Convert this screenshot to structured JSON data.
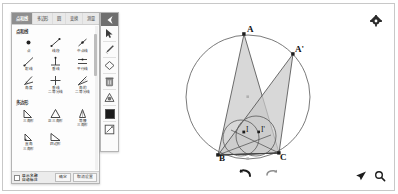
{
  "app": {
    "title": "几何画板",
    "accent": "#8f8f8f",
    "canvas_bg": "#ffffff",
    "shape_fill": "#c9c9c9",
    "stroke": "#4a4a4a"
  },
  "panel": {
    "tabs": [
      {
        "label": "点和线",
        "active": true
      },
      {
        "label": "多边形",
        "active": false
      },
      {
        "label": "圆",
        "active": false
      },
      {
        "label": "变换",
        "active": false
      },
      {
        "label": "测量",
        "active": false
      }
    ],
    "sections": [
      {
        "title": "点和线",
        "tools": [
          {
            "icon": "point-icon",
            "label": "点"
          },
          {
            "icon": "segment-icon",
            "label": "线段"
          },
          {
            "icon": "midpoint-icon",
            "label": "中点线"
          },
          {
            "icon": "ray-icon",
            "label": "射线"
          },
          {
            "icon": "perpendicular-icon",
            "label": "垂线"
          },
          {
            "icon": "parallel-icon",
            "label": "平行线"
          },
          {
            "icon": "angle-icon",
            "label": "角度"
          },
          {
            "icon": "perp-bisector-icon",
            "label": "垂线\n二等分线"
          },
          {
            "icon": "angle-bisector-icon",
            "label": "角的\n二等分线"
          }
        ]
      },
      {
        "title": "多边形",
        "tools": [
          {
            "icon": "triangle-right-icon",
            "label": "三角形"
          },
          {
            "icon": "triangle-equi-icon",
            "label": "正三角形"
          },
          {
            "icon": "triangle-iso-icon",
            "label": "等腰\n三角形"
          },
          {
            "icon": "triangle-rt-icon",
            "label": "直角\n三角形"
          },
          {
            "icon": "quad-icon",
            "label": "四边形"
          }
        ]
      }
    ],
    "footer": {
      "checkbox_label": "显示名称\n自动标注",
      "ok_label": "确定",
      "cancel_label": "取消设置"
    }
  },
  "vertical_toolbar": {
    "items": [
      {
        "icon": "menu-collapse-icon",
        "name": "collapse"
      },
      {
        "icon": "cursor-icon",
        "name": "select"
      },
      {
        "icon": "pen-icon",
        "name": "pen"
      },
      {
        "icon": "eraser-icon",
        "name": "eraser"
      },
      {
        "icon": "trash-icon",
        "name": "delete"
      },
      {
        "icon": "shape-icon",
        "name": "shape"
      },
      {
        "icon": "color-swatch-icon",
        "name": "color"
      },
      {
        "icon": "edit-icon",
        "name": "edit"
      }
    ],
    "current_color": "#1b1b1b"
  },
  "canvas_controls": {
    "settings_icon": "gear-icon",
    "undo_icon": "undo-arrow-icon",
    "redo_icon": "redo-arrow-icon",
    "pointer_icon": "pointer-send-icon",
    "zoom_icon": "magnifier-icon"
  },
  "figure": {
    "type": "geometry-construction",
    "points": [
      {
        "label": "A",
        "x": 241,
        "y": 30
      },
      {
        "label": "A'",
        "x": 290,
        "y": 50
      },
      {
        "label": "B",
        "x": 215,
        "y": 151
      },
      {
        "label": "C",
        "x": 276,
        "y": 149
      },
      {
        "label": "I",
        "x": 241,
        "y": 128
      },
      {
        "label": "I'",
        "x": 256,
        "y": 128
      }
    ],
    "circumcircle": {
      "cx": 245,
      "cy": 93,
      "r": 62
    },
    "incircle_1": {
      "cx": 238,
      "cy": 134,
      "r": 18
    },
    "incircle_2": {
      "cx": 253,
      "cy": 132,
      "r": 20
    },
    "triangles": [
      {
        "name": "ABC",
        "vertices": [
          "A",
          "B",
          "C"
        ]
      },
      {
        "name": "A'BC",
        "vertices": [
          "A'",
          "B",
          "C"
        ]
      }
    ]
  }
}
